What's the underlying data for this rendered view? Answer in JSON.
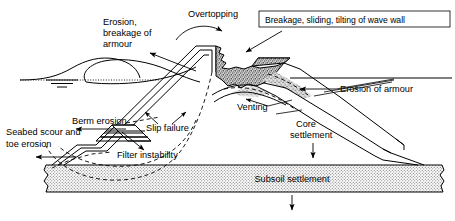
{
  "figure": {
    "kind": "engineering-cross-section",
    "background_color": "#ffffff",
    "line_color": "#000000",
    "fill_color": "#ffffff",
    "subsoil_fill_color": "#d0d0d0",
    "armour_fill_color": "#b8b8b8"
  },
  "labels": {
    "overtopping": "Overtopping",
    "erosion_breakage_armour_line1": "Erosion,",
    "erosion_breakage_armour_line2": "breakage of",
    "erosion_breakage_armour_line3": "armour",
    "wave_wall": "Breakage, sliding, tilting of wave wall",
    "erosion_of_armour": "Erosion of armour",
    "venting": "Venting",
    "berm_erosion": "Berm erosion",
    "seabed_scour_line1": "Seabed scour and",
    "seabed_scour_line2": "toe erosion",
    "slip_failure": "Slip failure",
    "filter_instability": "Filter instability",
    "core_settlement_line1": "Core",
    "core_settlement_line2": "settlement",
    "subsoil_settlement": "Subsoil settlement"
  },
  "parts": {
    "still_water_level": "still-water-level-symbol",
    "wave": "breaking-wave",
    "crown_wall": "crown-wave-wall",
    "armour_layer": "armour-layer",
    "berm": "berm",
    "core": "core",
    "subsoil": "subsoil-layer",
    "seabed": "seabed"
  }
}
